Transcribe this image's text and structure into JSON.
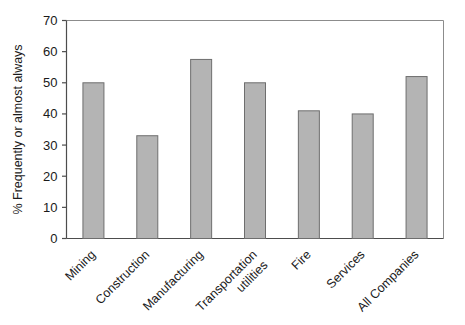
{
  "chart_data": {
    "type": "bar",
    "title": "",
    "xlabel": "",
    "ylabel": "% Frequently or almost always",
    "categories": [
      "Mining",
      "Construction",
      "Manufacturing",
      "Transportation utilities",
      "Fire",
      "Services",
      "All Companies"
    ],
    "category_lines": [
      [
        "Mining"
      ],
      [
        "Construction"
      ],
      [
        "Manufacturing"
      ],
      [
        "Transportation",
        "utilities"
      ],
      [
        "Fire"
      ],
      [
        "Services"
      ],
      [
        "All Companies"
      ]
    ],
    "values": [
      50,
      33,
      57.5,
      50,
      41,
      40,
      52
    ],
    "ylim": [
      0,
      70
    ],
    "yticks": [
      0,
      10,
      20,
      30,
      40,
      50,
      60,
      70
    ],
    "ytick_labels": [
      "0",
      "10",
      "20",
      "30",
      "40",
      "50",
      "60",
      "70"
    ],
    "grid": false,
    "legend": null,
    "bar_color": "#b4b4b4",
    "bar_edge_color": "#6e6e6e",
    "axis_color": "#4d4d4d",
    "frame_color": "#8c8c8c",
    "label_rotation": -45
  }
}
